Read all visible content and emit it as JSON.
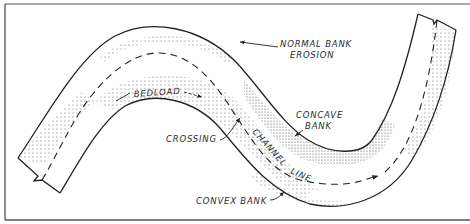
{
  "diagram": {
    "colors": {
      "line": "#222222",
      "stipple": "#555555",
      "frame": "#444444",
      "background": "#ffffff"
    },
    "labels": {
      "normal_bank_erosion_line1": "NORMAL BANK",
      "normal_bank_erosion_line2": "EROSION",
      "bedload": "BEDLOAD",
      "concave_bank_line1": "CONCAVE",
      "concave_bank_line2": "BANK",
      "crossing": "CROSSING",
      "channel_line_word1": "CHANNEL",
      "channel_line_word2": "LINE",
      "convex_bank": "CONVEX BANK"
    }
  }
}
